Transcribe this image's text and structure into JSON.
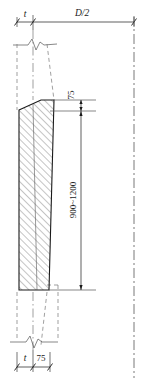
{
  "drawing": {
    "title": "Tapered wall section detail",
    "labels": {
      "thickness_top": "t",
      "half_diameter": "D/2",
      "offset_top": "75",
      "height_range": "900~1200",
      "thickness_bottom": "t",
      "offset_bottom": "75"
    },
    "colors": {
      "line": "#1a1a1a",
      "thin_line": "#555555",
      "hatch": "#6b6b6b",
      "background": "#ffffff"
    },
    "elements": {
      "centerline": "centerline-dash-dot",
      "break_symbol_top": "zigzag-break",
      "break_symbol_bottom": "zigzag-break",
      "hatch_pattern": "diagonal-45-hatch",
      "section_name": "wall-section"
    }
  }
}
